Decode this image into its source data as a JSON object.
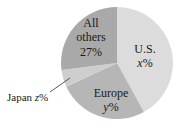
{
  "chart_data": {
    "type": "pie",
    "title": "",
    "slices": [
      {
        "label": "U.S.",
        "value_label": "x%",
        "value": 42,
        "color": "#dcdcdc"
      },
      {
        "label": "Europe",
        "value_label": "y%",
        "value": 26,
        "color": "#b6b6b6"
      },
      {
        "label": "Japan",
        "value_label": "z%",
        "value": 5,
        "color": "#cecece"
      },
      {
        "label": "All others",
        "value_label": "27%",
        "value": 27,
        "color": "#a9a9a9"
      }
    ],
    "start_angle_deg": 0,
    "direction": "clockwise",
    "annotations": [
      {
        "text": "Japan z%",
        "callout": true
      }
    ]
  },
  "labels": {
    "us_name": "U.S.",
    "us_value_var": "x",
    "us_pct": "%",
    "europe_name": "Europe",
    "europe_value_var": "y",
    "europe_pct": "%",
    "others_line1": "All",
    "others_line2": "others",
    "others_value": "27%",
    "japan_name": "Japan ",
    "japan_value_var": "z",
    "japan_pct": "%"
  }
}
